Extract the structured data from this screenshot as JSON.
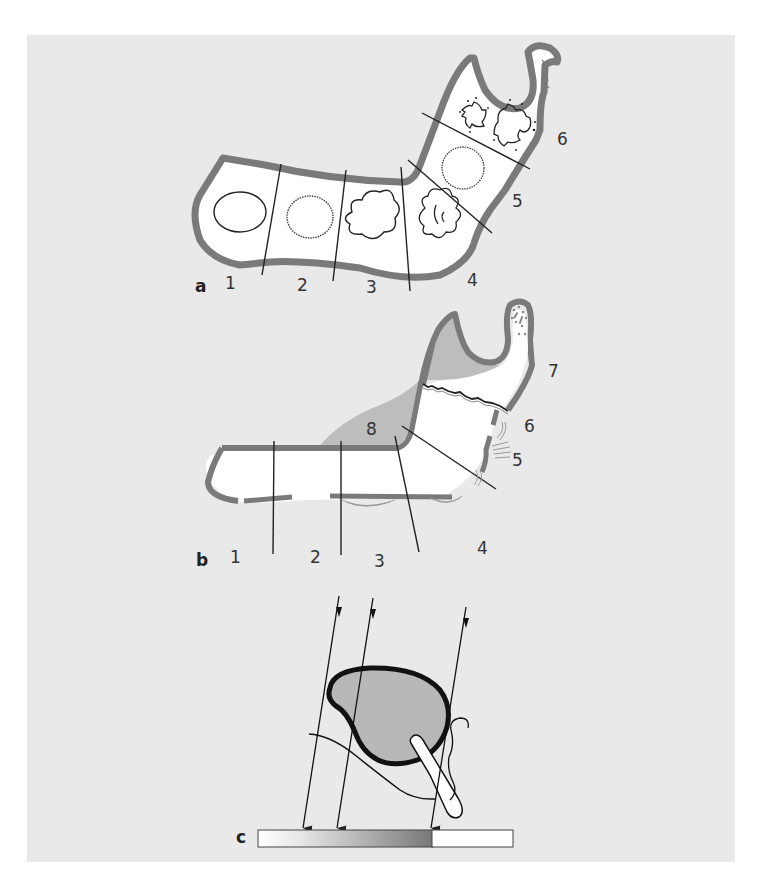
{
  "figure": {
    "background_color": "#e9e9e9",
    "outline_color": "#7a7a7a",
    "panels": [
      {
        "id": "a",
        "label": "a",
        "zone_labels": [
          "1",
          "2",
          "3",
          "4",
          "5",
          "6"
        ],
        "elements": [
          "oval-solid",
          "oval-dotted",
          "cloud-shape",
          "lobulated-cloud",
          "dotted-circle",
          "spiky-lesions"
        ]
      },
      {
        "id": "b",
        "label": "b",
        "zone_labels": [
          "1",
          "2",
          "3",
          "4",
          "5",
          "6",
          "7",
          "8"
        ],
        "elements": [
          "shaded-region-8",
          "fracture-line",
          "periosteal-reaction-3",
          "periosteal-reaction-4",
          "periosteal-reaction-5",
          "sequestrum-dots"
        ]
      },
      {
        "id": "c",
        "label": "c",
        "elements": [
          "x-ray-beams",
          "shaded-lesion",
          "nerve-line",
          "tooth-root",
          "gradient-detector"
        ]
      }
    ]
  }
}
